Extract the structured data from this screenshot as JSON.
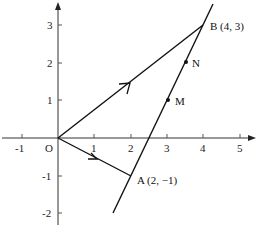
{
  "diagram": {
    "type": "coordinate-plane-vectors",
    "origin_label": "O",
    "x_ticks": [
      "-1",
      "1",
      "2",
      "3",
      "4",
      "5"
    ],
    "y_ticks": [
      "3",
      "2",
      "1",
      "-1",
      "-2"
    ],
    "points": {
      "A": {
        "label": "A (2, −1)",
        "x": 2,
        "y": -1
      },
      "B": {
        "label": "B (4, 3)",
        "x": 4,
        "y": 3
      },
      "M": {
        "label": "M"
      },
      "N": {
        "label": "N"
      }
    },
    "vectors": [
      {
        "from": "O",
        "to": "A"
      },
      {
        "from": "O",
        "to": "B"
      }
    ],
    "line": {
      "through": [
        "A",
        "B"
      ]
    }
  }
}
